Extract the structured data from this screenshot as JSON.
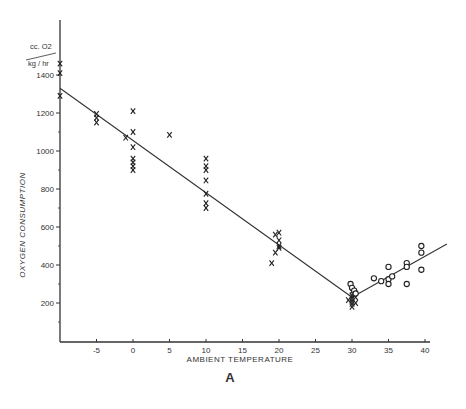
{
  "chart_data": {
    "type": "scatter",
    "title": "",
    "figure_label": "A",
    "xlabel": "AMBIENT TEMPERATURE",
    "ylabel": "OXYGEN CONSUMPTION",
    "yunit_top": "cc. O2",
    "yunit_bottom": "kg / hr",
    "xlim": [
      -10,
      42
    ],
    "ylim": [
      0,
      1500
    ],
    "xticks": [
      -5,
      0,
      5,
      10,
      15,
      20,
      25,
      30,
      35,
      40
    ],
    "yticks": [
      200,
      400,
      600,
      800,
      1000,
      1200,
      1400
    ],
    "grid": false,
    "legend": null,
    "series": [
      {
        "name": "below thermoneutral",
        "marker": "x",
        "points": [
          [
            -10,
            1460
          ],
          [
            -10,
            1410
          ],
          [
            -10,
            1290
          ],
          [
            -5,
            1195
          ],
          [
            -5,
            1175
          ],
          [
            -5,
            1150
          ],
          [
            -1,
            1070
          ],
          [
            0,
            1210
          ],
          [
            0,
            1100
          ],
          [
            0,
            1020
          ],
          [
            0,
            960
          ],
          [
            0,
            940
          ],
          [
            0,
            920
          ],
          [
            0,
            900
          ],
          [
            5,
            1085
          ],
          [
            10,
            960
          ],
          [
            10,
            920
          ],
          [
            10,
            900
          ],
          [
            10,
            845
          ],
          [
            10,
            775
          ],
          [
            10,
            725
          ],
          [
            10,
            700
          ],
          [
            19,
            410
          ],
          [
            19.5,
            560
          ],
          [
            20,
            570
          ],
          [
            20,
            530
          ],
          [
            20,
            500
          ],
          [
            20,
            490
          ],
          [
            19.5,
            465
          ],
          [
            30,
            260
          ],
          [
            30,
            240
          ],
          [
            30,
            225
          ],
          [
            30,
            210
          ],
          [
            30,
            195
          ],
          [
            30,
            180
          ],
          [
            30.5,
            230
          ],
          [
            30.5,
            200
          ],
          [
            29.5,
            215
          ]
        ]
      },
      {
        "name": "above thermoneutral",
        "marker": "o",
        "points": [
          [
            29.8,
            300
          ],
          [
            30,
            280
          ],
          [
            30.3,
            265
          ],
          [
            30.5,
            250
          ],
          [
            33,
            330
          ],
          [
            34,
            315
          ],
          [
            35,
            390
          ],
          [
            35,
            325
          ],
          [
            35,
            300
          ],
          [
            35.5,
            340
          ],
          [
            37.5,
            410
          ],
          [
            37.5,
            390
          ],
          [
            37.5,
            300
          ],
          [
            39.5,
            500
          ],
          [
            39.5,
            465
          ],
          [
            39.5,
            375
          ]
        ]
      }
    ],
    "fit_lines": [
      {
        "name": "cold regression",
        "from": [
          -10,
          1330
        ],
        "to": [
          30,
          230
        ]
      },
      {
        "name": "warm regression",
        "from": [
          30,
          230
        ],
        "to": [
          43,
          510
        ]
      }
    ]
  }
}
